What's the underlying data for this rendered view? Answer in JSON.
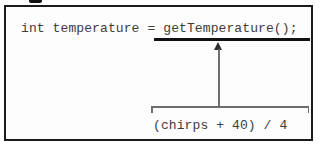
{
  "figure": {
    "code_line": {
      "prefix": "int temperature = ",
      "highlighted_call": "getTemperature();"
    },
    "callout": {
      "expression": "(chirps + 40) / 4"
    },
    "colors": {
      "border": "#1b1b1b",
      "code_text": "#3c3c3c",
      "underline": "#111111",
      "connector": "#6e6e6e",
      "arrowhead": "#2e2e2e",
      "background": "#fdfdfd"
    }
  }
}
